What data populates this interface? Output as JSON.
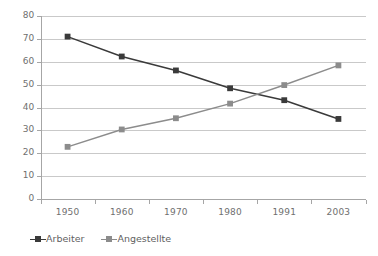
{
  "chart_data": {
    "type": "line",
    "title": "",
    "xlabel": "",
    "ylabel": "",
    "categories": [
      "1950",
      "1960",
      "1970",
      "1980",
      "1991",
      "2003"
    ],
    "ylim": [
      0,
      80
    ],
    "yticks": [
      "0",
      "10",
      "20",
      "30",
      "40",
      "50",
      "60",
      "70",
      "80"
    ],
    "grid": "horizontal",
    "legend_position": "bottom-left",
    "series": [
      {
        "name": "Arbeiter",
        "color": "#3a3a3a",
        "marker": "square",
        "values": [
          71,
          62.3,
          56.2,
          48.4,
          43.2,
          35
        ]
      },
      {
        "name": "Angestellte",
        "color": "#8c8c8c",
        "marker": "square",
        "values": [
          22.8,
          30.4,
          35.3,
          41.7,
          49.8,
          58.4
        ]
      }
    ]
  },
  "axes": {
    "axis_color": "#a6a6a6",
    "grid_color": "#c9c9c9",
    "tick_text_color": "#6f6f6f"
  },
  "legend": {
    "items": [
      {
        "label": "Arbeiter",
        "color": "#3a3a3a"
      },
      {
        "label": "Angestellte",
        "color": "#8c8c8c"
      }
    ]
  }
}
